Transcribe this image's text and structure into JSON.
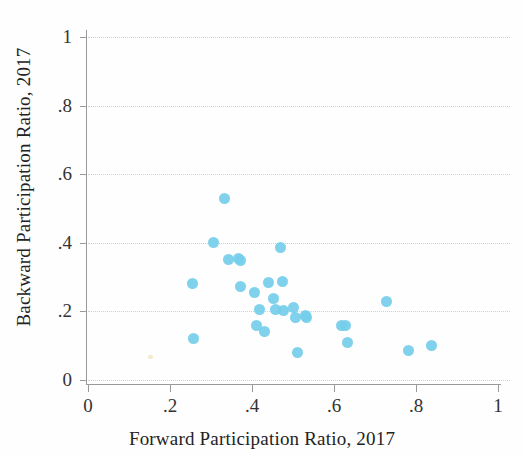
{
  "chart_data": {
    "type": "scatter",
    "title": "",
    "xlabel": "Forward Participation Ratio, 2017",
    "ylabel": "Backward Participation Ratio, 2017",
    "xlim": [
      0,
      1
    ],
    "ylim": [
      0,
      1.05
    ],
    "xticks": [
      "0",
      ".2",
      ".4",
      ".6",
      ".8",
      "1"
    ],
    "xtick_values": [
      0,
      0.2,
      0.4,
      0.6,
      0.8,
      1
    ],
    "yticks": [
      "0",
      ".2",
      ".4",
      ".6",
      ".8",
      "1"
    ],
    "ytick_values": [
      0,
      0.2,
      0.4,
      0.6,
      0.8,
      1
    ],
    "grid": "horizontal-dotted",
    "legend": "none",
    "marker_color": "#74cdea",
    "marker_size_px": 11,
    "points": [
      {
        "x": 0.256,
        "y": 0.28
      },
      {
        "x": 0.258,
        "y": 0.122
      },
      {
        "x": 0.305,
        "y": 0.4
      },
      {
        "x": 0.334,
        "y": 0.53
      },
      {
        "x": 0.342,
        "y": 0.352
      },
      {
        "x": 0.368,
        "y": 0.355
      },
      {
        "x": 0.373,
        "y": 0.348
      },
      {
        "x": 0.372,
        "y": 0.272
      },
      {
        "x": 0.405,
        "y": 0.255
      },
      {
        "x": 0.412,
        "y": 0.158
      },
      {
        "x": 0.418,
        "y": 0.205
      },
      {
        "x": 0.43,
        "y": 0.142
      },
      {
        "x": 0.441,
        "y": 0.283
      },
      {
        "x": 0.452,
        "y": 0.238
      },
      {
        "x": 0.458,
        "y": 0.205
      },
      {
        "x": 0.47,
        "y": 0.385
      },
      {
        "x": 0.474,
        "y": 0.288
      },
      {
        "x": 0.478,
        "y": 0.202
      },
      {
        "x": 0.5,
        "y": 0.21
      },
      {
        "x": 0.505,
        "y": 0.182
      },
      {
        "x": 0.51,
        "y": 0.08
      },
      {
        "x": 0.53,
        "y": 0.188
      },
      {
        "x": 0.534,
        "y": 0.182
      },
      {
        "x": 0.618,
        "y": 0.16
      },
      {
        "x": 0.628,
        "y": 0.158
      },
      {
        "x": 0.634,
        "y": 0.108
      },
      {
        "x": 0.728,
        "y": 0.23
      },
      {
        "x": 0.782,
        "y": 0.085
      },
      {
        "x": 0.838,
        "y": 0.1
      }
    ]
  }
}
